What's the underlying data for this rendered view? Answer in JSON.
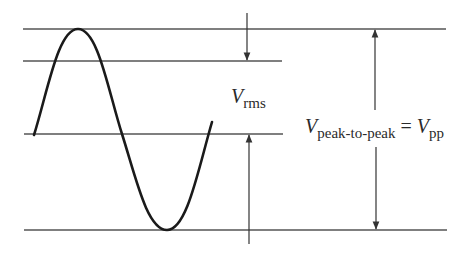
{
  "diagram": {
    "colors": {
      "line": "#555555",
      "wave": "#1a1a1a",
      "text": "#2a2a2a",
      "background": "#ffffff"
    },
    "labels": {
      "vrms": {
        "symbol": "V",
        "subscript": "rms"
      },
      "vpp": {
        "symbol": "V",
        "subscript": "peak-to-peak",
        "equals": "=",
        "symbol2": "V",
        "subscript2": "pp"
      }
    },
    "reference_lines": [
      {
        "name": "peak",
        "y": 29,
        "x1": 23,
        "x2": 446
      },
      {
        "name": "rms-level",
        "y": 61,
        "x1": 23,
        "x2": 282
      },
      {
        "name": "zero",
        "y": 134,
        "x1": 24,
        "x2": 283
      },
      {
        "name": "trough",
        "y": 230,
        "x1": 24,
        "x2": 447
      }
    ],
    "waveform": {
      "type": "sine",
      "start_x": 34,
      "end_x": 212,
      "zero_y": 134,
      "peak_y": 29,
      "trough_y": 230
    }
  }
}
